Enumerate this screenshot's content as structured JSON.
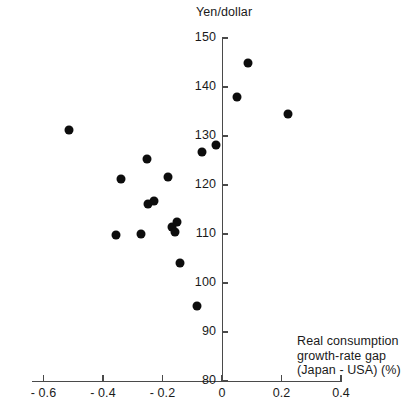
{
  "chart_data": {
    "type": "scatter",
    "title": "",
    "ylabel": "Yen/dollar",
    "xlabel_lines": [
      "Real consumption",
      "growth-rate gap",
      "(Japan - USA) (%)"
    ],
    "xlabel": "Real consumption growth-rate gap (Japan - USA) (%)",
    "xlim": [
      -0.7,
      0.4
    ],
    "ylim": [
      80,
      150
    ],
    "xticks": [
      -0.6,
      -0.4,
      -0.2,
      0,
      0.2,
      0.4
    ],
    "xticklabels": [
      "- 0.6",
      "- 0.4",
      "- 0.2",
      "0",
      "0.2",
      "0.4"
    ],
    "yticks": [
      80,
      90,
      100,
      110,
      120,
      130,
      140,
      150
    ],
    "yticklabels": [
      "80",
      "90",
      "100",
      "110",
      "120",
      "130",
      "140",
      "150"
    ],
    "grid": false,
    "legend": false,
    "marker": "filled-circle",
    "marker_color": "#0d0d0d",
    "points": [
      {
        "x": -0.513,
        "y": 131.3
      },
      {
        "x": -0.356,
        "y": 109.8
      },
      {
        "x": -0.34,
        "y": 121.2
      },
      {
        "x": -0.272,
        "y": 110.0
      },
      {
        "x": -0.252,
        "y": 125.3
      },
      {
        "x": -0.25,
        "y": 116.2
      },
      {
        "x": -0.229,
        "y": 116.7
      },
      {
        "x": -0.18,
        "y": 121.6
      },
      {
        "x": -0.168,
        "y": 111.5
      },
      {
        "x": -0.158,
        "y": 110.5
      },
      {
        "x": -0.15,
        "y": 112.5
      },
      {
        "x": -0.14,
        "y": 104.0
      },
      {
        "x": -0.084,
        "y": 95.3
      },
      {
        "x": -0.067,
        "y": 126.8
      },
      {
        "x": -0.02,
        "y": 128.2
      },
      {
        "x": 0.05,
        "y": 138.0
      },
      {
        "x": 0.087,
        "y": 145.0
      },
      {
        "x": 0.222,
        "y": 134.5
      }
    ]
  }
}
